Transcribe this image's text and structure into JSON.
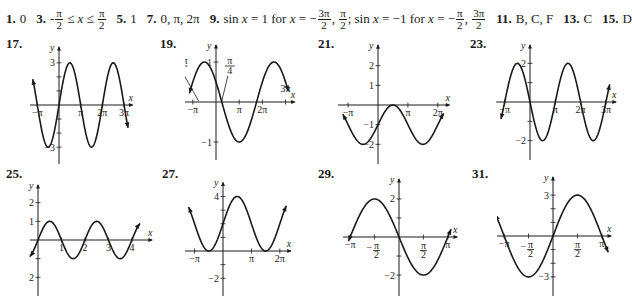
{
  "answers_line": {
    "items": [
      {
        "num": "1.",
        "text": "0"
      },
      {
        "num": "3.",
        "parts": [
          "-",
          {
            "frac": [
              "π",
              "2"
            ]
          },
          " ≤ ",
          {
            "it": "x"
          },
          " ≤ ",
          {
            "frac": [
              "π",
              "2"
            ]
          }
        ]
      },
      {
        "num": "5.",
        "text": "1"
      },
      {
        "num": "7.",
        "text": "0, π, 2π"
      },
      {
        "num": "9.",
        "parts": [
          "sin ",
          {
            "it": "x"
          },
          " = 1 for ",
          {
            "it": "x"
          },
          " = −",
          {
            "frac": [
              "3π",
              "2"
            ]
          },
          ", ",
          {
            "frac": [
              "π",
              "2"
            ]
          },
          "; sin ",
          {
            "it": "x"
          },
          " = −1 for ",
          {
            "it": "x"
          },
          " = −",
          {
            "frac": [
              "π",
              "2"
            ]
          },
          ", ",
          {
            "frac": [
              "3π",
              "2"
            ]
          }
        ]
      },
      {
        "num": "11.",
        "text": "B, C, F"
      },
      {
        "num": "13.",
        "text": "C"
      },
      {
        "num": "15.",
        "text": "D"
      }
    ]
  },
  "chart_data": [
    {
      "id": "17",
      "type": "line",
      "label": "17.",
      "function": "3 sin x",
      "xlabel": "x",
      "ylabel": "y",
      "x_ticks": [
        {
          "v": -3.14159,
          "label": "−π"
        },
        {
          "v": 3.14159,
          "label": "π"
        },
        {
          "v": 6.28318,
          "label": "2π"
        },
        {
          "v": 9.42478,
          "label": "3π"
        }
      ],
      "y_ticks": [
        {
          "v": 3,
          "label": "3"
        },
        {
          "v": -3,
          "label": "−3"
        },
        {
          "v": 1,
          "label": ""
        },
        {
          "v": 2,
          "label": ""
        },
        {
          "v": -1,
          "label": ""
        },
        {
          "v": -2,
          "label": ""
        }
      ],
      "xlim": [
        -4.2,
        10.8
      ],
      "ylim": [
        -4.2,
        4.2
      ],
      "curve_range": [
        -3.8,
        10.0
      ],
      "amplitude": 3,
      "freq": 1,
      "phase": 0,
      "shift": 0
    },
    {
      "id": "19",
      "type": "line",
      "label": "19.",
      "function": "sin(2x + π/2)... shown as sin(2(x − π/4) + π) style: zeros at −3π/4, π/4",
      "xlabel": "x",
      "ylabel": "y",
      "x_ticks": [
        {
          "v": -3.14159,
          "label": "−π"
        },
        {
          "v": 3.14159,
          "label": "π"
        },
        {
          "v": 6.28318,
          "label": "2π"
        },
        {
          "v": 9.42478,
          "label": "3π",
          "above": true
        }
      ],
      "annotations": [
        {
          "v": -2.35619,
          "label_top": "3π",
          "label_bot": "4",
          "neg": true
        },
        {
          "v": 0.7854,
          "label_top": "π",
          "label_bot": "4"
        }
      ],
      "y_ticks": [
        {
          "v": 1,
          "label": "1"
        },
        {
          "v": -1,
          "label": "−1"
        }
      ],
      "xlim": [
        -4.2,
        10.8
      ],
      "ylim": [
        -1.45,
        1.45
      ],
      "curve_range": [
        -3.6,
        9.8
      ],
      "amplitude": 1,
      "freq": 0.6667,
      "phase": 2.618,
      "shift": 0
    },
    {
      "id": "21",
      "type": "line",
      "label": "21.",
      "function": "sin x − 1 shifted: min −2, max 0",
      "xlabel": "x",
      "ylabel": "y",
      "x_ticks": [
        {
          "v": -3.14159,
          "label": "−π"
        },
        {
          "v": 3.14159,
          "label": "π"
        },
        {
          "v": 6.28318,
          "label": "2π"
        }
      ],
      "y_ticks": [
        {
          "v": 2,
          "label": "2"
        },
        {
          "v": 1,
          "label": "1"
        },
        {
          "v": -1,
          "label": "−1"
        },
        {
          "v": -2,
          "label": "−2"
        }
      ],
      "xlim": [
        -4.2,
        7.6
      ],
      "ylim": [
        -3.0,
        3.1
      ],
      "curve_range": [
        -3.7,
        6.9
      ],
      "amplitude": 1,
      "freq": 1,
      "phase": 0,
      "shift": -1
    },
    {
      "id": "23",
      "type": "line",
      "label": "23.",
      "function": "−2 sin x",
      "xlabel": "x",
      "ylabel": "y",
      "x_ticks": [
        {
          "v": -3.14159,
          "label": "−π"
        },
        {
          "v": 3.14159,
          "label": "π"
        },
        {
          "v": 6.28318,
          "label": "2π"
        },
        {
          "v": 9.42478,
          "label": "3π"
        }
      ],
      "y_ticks": [
        {
          "v": 2,
          "label": "2"
        },
        {
          "v": -2,
          "label": "−2"
        },
        {
          "v": 1,
          "label": ""
        },
        {
          "v": -1,
          "label": ""
        }
      ],
      "xlim": [
        -4.2,
        10.8
      ],
      "ylim": [
        -3.0,
        3.0
      ],
      "curve_range": [
        -3.6,
        9.9
      ],
      "amplitude": -2,
      "freq": 1,
      "phase": 0,
      "shift": 0
    },
    {
      "id": "25",
      "type": "line",
      "label": "25.",
      "function": "sin(πx)",
      "xlabel": "x",
      "ylabel": "y",
      "x_ticks": [
        {
          "v": 1,
          "label": "1"
        },
        {
          "v": 2,
          "label": "2"
        },
        {
          "v": 3,
          "label": "3"
        },
        {
          "v": 4,
          "label": "4"
        }
      ],
      "y_ticks": [
        {
          "v": 2,
          "label": "2"
        },
        {
          "v": 1,
          "label": "1"
        },
        {
          "v": -1,
          "label": ""
        },
        {
          "v": -2,
          "label": "−2"
        }
      ],
      "xlim": [
        -0.35,
        4.9
      ],
      "ylim": [
        -3.0,
        3.0
      ],
      "curve_range": [
        -0.35,
        4.35
      ],
      "amplitude": 1,
      "freq": 3.14159,
      "phase": 0,
      "shift": 0
    },
    {
      "id": "27",
      "type": "line",
      "label": "27.",
      "function": "2 sin x + 2",
      "xlabel": "x",
      "ylabel": "y",
      "x_ticks": [
        {
          "v": -3.14159,
          "label": "−π"
        },
        {
          "v": 3.14159,
          "label": "π"
        },
        {
          "v": 6.28318,
          "label": "2π"
        }
      ],
      "y_ticks": [
        {
          "v": 4,
          "label": "4"
        },
        {
          "v": 2,
          "label": ""
        },
        {
          "v": 1,
          "label": ""
        },
        {
          "v": 3,
          "label": ""
        },
        {
          "v": -1,
          "label": ""
        },
        {
          "v": -2,
          "label": "−2"
        }
      ],
      "xlim": [
        -4.2,
        7.6
      ],
      "ylim": [
        -3.3,
        5.1
      ],
      "curve_range": [
        -3.8,
        7.0
      ],
      "amplitude": 2,
      "freq": 1,
      "phase": 0,
      "shift": 2
    },
    {
      "id": "29",
      "type": "line",
      "label": "29.",
      "function": "−2 sin(x·1.5)... zeros at −π·0.7, 0, π·0.7",
      "xlabel": "x",
      "ylabel": "y",
      "x_ticks": [
        {
          "v": -3.14159,
          "label": "−π"
        },
        {
          "v": -1.5708,
          "label_top": "π",
          "label_bot": "2",
          "neg": true
        },
        {
          "v": 1.5708,
          "label_top": "π",
          "label_bot": "2"
        },
        {
          "v": 3.14159,
          "label": "π"
        }
      ],
      "y_ticks": [
        {
          "v": 2,
          "label": "2"
        },
        {
          "v": 1,
          "label": ""
        },
        {
          "v": -1,
          "label": ""
        },
        {
          "v": -2,
          "label": "−2"
        }
      ],
      "xlim": [
        -3.6,
        3.8
      ],
      "ylim": [
        -3.1,
        3.1
      ],
      "curve_range": [
        -3.25,
        3.35
      ],
      "amplitude": -2,
      "freq": 1.0,
      "phase": 0,
      "shift": 0
    },
    {
      "id": "31",
      "type": "line",
      "label": "31.",
      "function": "3 sin x",
      "xlabel": "x",
      "ylabel": "y",
      "x_ticks": [
        {
          "v": -3.14159,
          "label": "−π"
        },
        {
          "v": -1.5708,
          "label_top": "π",
          "label_bot": "2",
          "neg": true
        },
        {
          "v": 1.5708,
          "label_top": "π",
          "label_bot": "2"
        },
        {
          "v": 3.14159,
          "label": "π"
        }
      ],
      "y_ticks": [
        {
          "v": 3,
          "label": "3"
        },
        {
          "v": 2,
          "label": ""
        },
        {
          "v": 1,
          "label": ""
        },
        {
          "v": -1,
          "label": ""
        },
        {
          "v": -2,
          "label": ""
        },
        {
          "v": -3,
          "label": "−3"
        }
      ],
      "xlim": [
        -3.6,
        3.8
      ],
      "ylim": [
        -4.4,
        4.4
      ],
      "curve_range": [
        -3.7,
        3.55
      ],
      "amplitude": 3,
      "freq": 1,
      "phase": 0,
      "shift": 0
    }
  ],
  "layout": {
    "graphs": [
      {
        "id": "17",
        "left": 4,
        "top": 36,
        "label_x": 6,
        "label_y": 36,
        "box": [
          30,
          44,
          125,
          120
        ],
        "origin": [
          59,
          105
        ]
      },
      {
        "id": "19",
        "left": 159,
        "top": 36,
        "label_x": 160,
        "label_y": 36,
        "box": [
          185,
          44,
          125,
          120
        ],
        "origin": [
          216,
          102
        ]
      },
      {
        "id": "21",
        "left": 314,
        "top": 36,
        "label_x": 318,
        "label_y": 36,
        "box": [
          338,
          44,
          115,
          120
        ],
        "origin": [
          378,
          105
        ]
      },
      {
        "id": "23",
        "left": 469,
        "top": 36,
        "label_x": 470,
        "label_y": 36,
        "box": [
          492,
          44,
          125,
          120
        ],
        "origin": [
          530,
          102
        ]
      },
      {
        "id": "25",
        "left": 4,
        "top": 166,
        "label_x": 6,
        "label_y": 166,
        "box": [
          28,
          176,
          125,
          120
        ],
        "origin": [
          38,
          240
        ]
      },
      {
        "id": "27",
        "left": 159,
        "top": 166,
        "label_x": 162,
        "label_y": 166,
        "box": [
          185,
          176,
          115,
          120
        ],
        "origin": [
          223,
          251
        ]
      },
      {
        "id": "29",
        "left": 314,
        "top": 166,
        "label_x": 318,
        "label_y": 166,
        "box": [
          343,
          176,
          120,
          120
        ],
        "origin": [
          399,
          237
        ]
      },
      {
        "id": "31",
        "left": 469,
        "top": 166,
        "label_x": 472,
        "label_y": 166,
        "box": [
          497,
          176,
          120,
          120
        ],
        "origin": [
          553,
          236
        ]
      }
    ]
  }
}
